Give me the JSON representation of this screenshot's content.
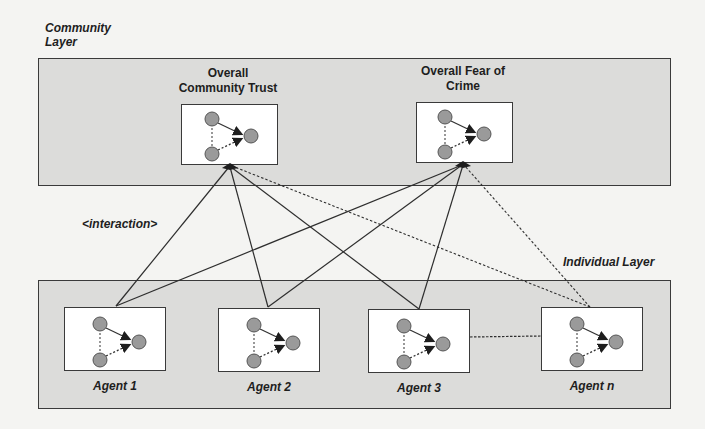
{
  "diagram": {
    "layers": {
      "community": {
        "label": "Community Layer"
      },
      "individual": {
        "label": "Individual Layer"
      }
    },
    "edge_label": "<interaction>",
    "community_nodes": [
      {
        "id": "trust",
        "title_line1": "Overall",
        "title_line2": "Community Trust"
      },
      {
        "id": "fear",
        "title_line1": "Overall Fear of",
        "title_line2": "Crime"
      }
    ],
    "agents": [
      {
        "id": "agent-1",
        "label": "Agent 1"
      },
      {
        "id": "agent-2",
        "label": "Agent 2"
      },
      {
        "id": "agent-3",
        "label": "Agent 3"
      },
      {
        "id": "agent-n",
        "label": "Agent n"
      }
    ],
    "edges": [
      {
        "from": "Agent 1",
        "to": "Overall Community Trust",
        "style": "solid"
      },
      {
        "from": "Agent 1",
        "to": "Overall Fear of Crime",
        "style": "solid"
      },
      {
        "from": "Agent 2",
        "to": "Overall Community Trust",
        "style": "solid"
      },
      {
        "from": "Agent 2",
        "to": "Overall Fear of Crime",
        "style": "solid"
      },
      {
        "from": "Agent 3",
        "to": "Overall Community Trust",
        "style": "solid"
      },
      {
        "from": "Agent 3",
        "to": "Overall Fear of Crime",
        "style": "solid"
      },
      {
        "from": "Agent n",
        "to": "Overall Community Trust",
        "style": "dashed"
      },
      {
        "from": "Agent n",
        "to": "Overall Fear of Crime",
        "style": "dashed"
      },
      {
        "from": "Agent 3",
        "to": "Agent n",
        "style": "dashed"
      }
    ],
    "inner_graph": {
      "nodes": 3,
      "edges": [
        {
          "from": "top",
          "to": "right",
          "style": "solid-arrow"
        },
        {
          "from": "bottom",
          "to": "right",
          "style": "dashed-arrow"
        },
        {
          "from": "top",
          "to": "bottom",
          "style": "dashed"
        }
      ]
    },
    "colors": {
      "layer_fill": "#dcdcda",
      "node_fill": "#9a9a9a",
      "stroke": "#3a3a3a",
      "background": "#f4f4f2"
    }
  }
}
